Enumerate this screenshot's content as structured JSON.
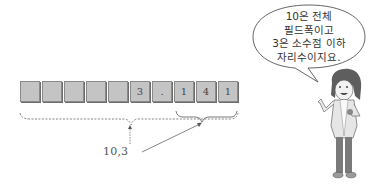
{
  "field": {
    "cells": [
      "",
      "",
      "",
      "",
      "",
      "3",
      ".",
      "1",
      "4",
      "1"
    ],
    "format_label": "10,3",
    "total_width": 10,
    "decimal_places": 3
  },
  "speech_bubble": {
    "lines": [
      "10은 전체",
      "필드폭이고",
      "3은 소수점 이하",
      "자리수이지요."
    ]
  },
  "colors": {
    "cell_fill": "#c4c4c4",
    "cell_border": "#8a8a8a",
    "line": "#555555"
  }
}
